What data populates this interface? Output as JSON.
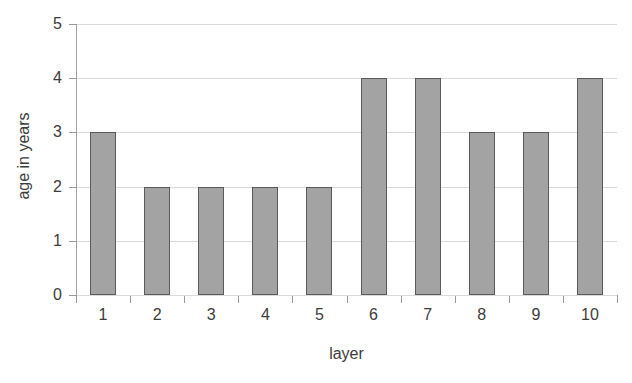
{
  "chart_data": {
    "type": "bar",
    "title": "",
    "xlabel": "layer",
    "ylabel": "age in years",
    "categories": [
      "1",
      "2",
      "3",
      "4",
      "5",
      "6",
      "7",
      "8",
      "9",
      "10"
    ],
    "values": [
      3,
      2,
      2,
      2,
      2,
      4,
      4,
      3,
      3,
      4
    ],
    "ylim": [
      0,
      5
    ],
    "ytick_labels": [
      "0",
      "1",
      "2",
      "3",
      "4",
      "5"
    ],
    "ytick_values": [
      0,
      1,
      2,
      3,
      4,
      5
    ],
    "grid": true,
    "legend": false,
    "colors": {
      "bar_fill": "#a3a3a3",
      "bar_border": "#5a5a5a",
      "gridline": "#dadada",
      "axis": "#9a9a9a",
      "text": "#3c3c3c",
      "background": "#ffffff"
    }
  }
}
